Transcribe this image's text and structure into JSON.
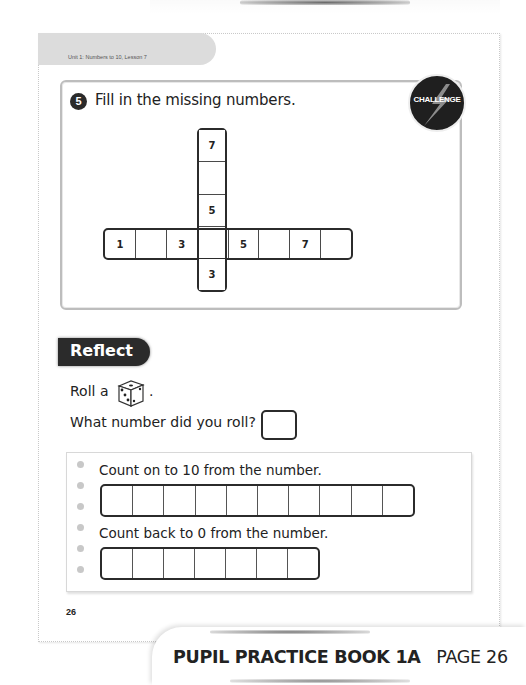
{
  "header": {
    "unit_label": "Unit 1: Numbers to 10, Lesson 7"
  },
  "question": {
    "number": "5",
    "instruction": "Fill in the missing numbers.",
    "badge": "CHALLENGE",
    "horizontal_row": [
      "1",
      "",
      "3",
      "",
      "5",
      "",
      "7",
      ""
    ],
    "vertical_column": [
      "7",
      "",
      "5",
      "",
      "3"
    ]
  },
  "reflect": {
    "title": "Reflect",
    "roll_text": "Roll a",
    "roll_icon": "dice-icon",
    "period": ".",
    "question": "What number did you roll?",
    "answer_value": "",
    "count_on_label": "Count on to 10 from the number.",
    "count_on_cells": [
      "",
      "",
      "",
      "",
      "",
      "",
      "",
      "",
      "",
      ""
    ],
    "count_back_label": "Count back to 0 from the number.",
    "count_back_cells": [
      "",
      "",
      "",
      "",
      "",
      "",
      ""
    ]
  },
  "page_number": "26",
  "footer": {
    "book_title": "PUPIL PRACTICE BOOK 1A",
    "page_label": "PAGE 26"
  }
}
